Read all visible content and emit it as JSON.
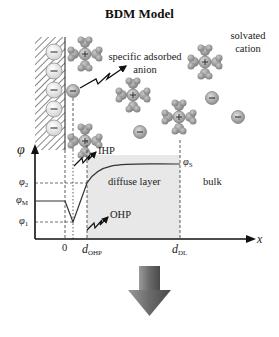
{
  "title": "BDM Model",
  "labels": {
    "solvated_cation_line1": "solvated",
    "solvated_cation_line2": "cation",
    "specific_adsorbed_line1": "specific adsorbed",
    "specific_adsorbed_line2": "anion",
    "ihp": "IHP",
    "ohp": "OHP",
    "diffuse_layer": "diffuse layer",
    "bulk": "bulk"
  },
  "axis": {
    "y_label": "φ",
    "x_label": "x",
    "y_ticks": [
      {
        "symbol": "φ",
        "sub": "2"
      },
      {
        "symbol": "φ",
        "sub": "M"
      },
      {
        "symbol": "φ",
        "sub": "1"
      }
    ],
    "phi_s": {
      "symbol": "φ",
      "sub": "S"
    },
    "x_ticks": [
      {
        "symbol": "0",
        "sub": ""
      },
      {
        "symbol": "d",
        "sub": "OHP"
      },
      {
        "symbol": "d",
        "sub": "DL"
      }
    ]
  },
  "icons": {
    "cation": "plus-sign",
    "anion": "minus-sign",
    "down_arrow": "down-arrow"
  },
  "colors": {
    "diffuse_fill": "#e6e6e6",
    "ion_grey": "#a8a8a8",
    "line": "#222222"
  }
}
